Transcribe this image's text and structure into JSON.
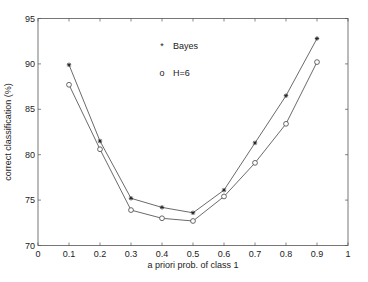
{
  "chart_data": {
    "type": "line",
    "title": "",
    "xlabel": "a priori prob. of class 1",
    "ylabel": "correct classification (%)",
    "xlim": [
      0,
      1
    ],
    "ylim": [
      70,
      95
    ],
    "grid": false,
    "legend_position": "upper center (inside axes)",
    "x": [
      0.1,
      0.2,
      0.3,
      0.4,
      0.5,
      0.6,
      0.7,
      0.8,
      0.9
    ],
    "x_ticks": [
      0,
      0.1,
      0.2,
      0.3,
      0.4,
      0.5,
      0.6,
      0.7,
      0.8,
      0.9,
      1
    ],
    "x_tick_labels": [
      "0",
      "0.1",
      "0.2",
      "0.3",
      "0.4",
      "0.5",
      "0.6",
      "0.7",
      "0.8",
      "0.9",
      "1"
    ],
    "y_ticks": [
      70,
      75,
      80,
      85,
      90,
      95
    ],
    "y_tick_labels": [
      "70",
      "75",
      "80",
      "85",
      "90",
      "95"
    ],
    "series": [
      {
        "name": "Bayes",
        "marker": "*",
        "legend_symbol": "*",
        "color": "#333333",
        "values": [
          89.9,
          81.5,
          75.2,
          74.2,
          73.6,
          76.1,
          81.3,
          86.5,
          92.8
        ]
      },
      {
        "name": "H=6",
        "marker": "o",
        "legend_symbol": "o",
        "color": "#333333",
        "values": [
          87.7,
          80.6,
          73.9,
          73.0,
          72.7,
          75.4,
          79.1,
          83.4,
          90.2
        ]
      }
    ]
  },
  "layout": {
    "plot_left": 38,
    "plot_right": 348,
    "plot_top": 18.5,
    "plot_bottom": 245.5,
    "axis_color": "#555555",
    "line_color": "#444444"
  }
}
